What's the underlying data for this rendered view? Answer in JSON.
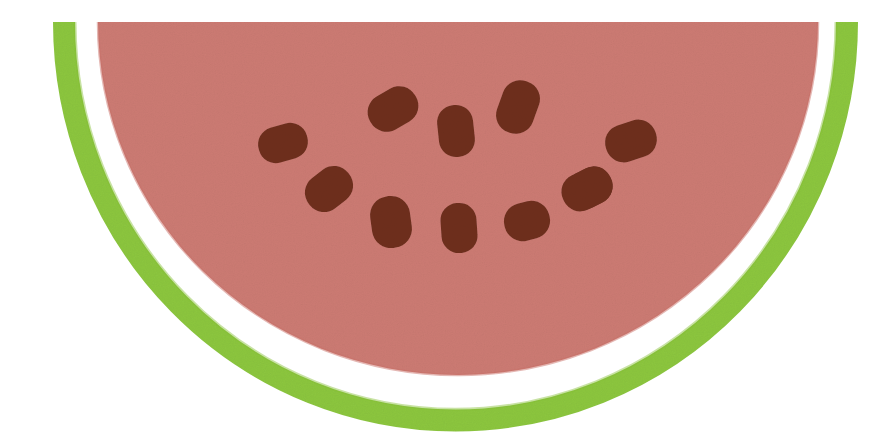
{
  "artwork": {
    "title": "Watermelon Slice",
    "subject": "watermelon-half-slice",
    "style": "flat-vector-illustration-with-paper-grain",
    "canvas": {
      "width": 892,
      "height": 434,
      "background_color": "#FFFFFF"
    },
    "palette": {
      "flesh_pink": "#CC7B73",
      "flesh_pink_edge": "#C97068",
      "rind_green": "#8CC63F",
      "rind_green_shade": "#84BE35",
      "seed_brown": "#6E2F1D",
      "seed_brown_dark": "#5E2716",
      "background_white": "#FFFFFF",
      "pith_white": "#FFFFFF"
    },
    "parts": [
      {
        "name": "rind-arc",
        "label": "Green rind",
        "color": "#8CC63F",
        "shape": "half-ellipse-stroke",
        "center_x": 455,
        "center_y": 22,
        "radius_x": 403,
        "radius_y": 398,
        "stroke_width": 22
      },
      {
        "name": "pith-gap",
        "label": "White pith gap",
        "color": "#FFFFFF",
        "shape": "half-ellipse-gap",
        "gap_width": 23
      },
      {
        "name": "flesh",
        "label": "Pink flesh",
        "color": "#CC7B73",
        "shape": "half-ellipse-fill",
        "center_x": 458,
        "center_y": 22,
        "radius_x": 360,
        "radius_y": 353
      }
    ],
    "seed_count": 11,
    "seeds": [
      {
        "id": 1,
        "name": "seed-upper-left",
        "cx": 283,
        "cy": 143,
        "rx": 25,
        "ry": 18,
        "rotation": -16
      },
      {
        "id": 2,
        "name": "seed-mid-left",
        "cx": 329,
        "cy": 189,
        "rx": 25,
        "ry": 19,
        "rotation": -38
      },
      {
        "id": 3,
        "name": "seed-top-left-inner",
        "cx": 393,
        "cy": 109,
        "rx": 26,
        "ry": 19,
        "rotation": -30
      },
      {
        "id": 4,
        "name": "seed-top-center",
        "cx": 456,
        "cy": 131,
        "rx": 18,
        "ry": 26,
        "rotation": -6
      },
      {
        "id": 5,
        "name": "seed-top-right-inner",
        "cx": 518,
        "cy": 107,
        "rx": 19,
        "ry": 27,
        "rotation": 20
      },
      {
        "id": 6,
        "name": "seed-upper-right",
        "cx": 631,
        "cy": 141,
        "rx": 26,
        "ry": 19,
        "rotation": -18
      },
      {
        "id": 7,
        "name": "seed-mid-right",
        "cx": 587,
        "cy": 189,
        "rx": 26,
        "ry": 19,
        "rotation": -26
      },
      {
        "id": 8,
        "name": "seed-bottom-left",
        "cx": 391,
        "cy": 222,
        "rx": 20,
        "ry": 26,
        "rotation": -8
      },
      {
        "id": 9,
        "name": "seed-bottom-center",
        "cx": 459,
        "cy": 228,
        "rx": 18,
        "ry": 25,
        "rotation": -4
      },
      {
        "id": 10,
        "name": "seed-bottom-right",
        "cx": 527,
        "cy": 221,
        "rx": 23,
        "ry": 19,
        "rotation": -14
      },
      {
        "id": 11,
        "name": "seed-far-right-bottom",
        "cx": 589,
        "cy": 188,
        "rx": 24,
        "ry": 19,
        "rotation": -28
      }
    ]
  }
}
